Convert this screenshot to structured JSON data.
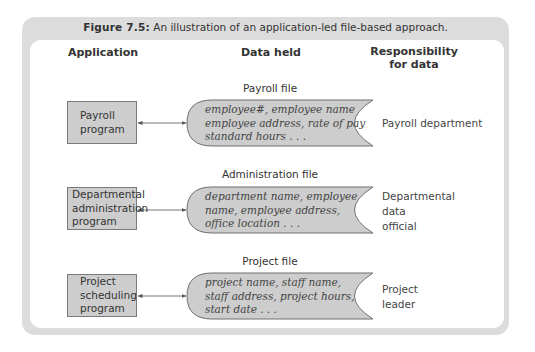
{
  "figure": {
    "label": "Figure 7.5:",
    "caption": " An illustration of an application-led file-based approach."
  },
  "headers": {
    "application": "Application",
    "data_held": "Data held",
    "responsibility_line1": "Responsibility",
    "responsibility_line2": "for data"
  },
  "rows": [
    {
      "file_label": "Payroll file",
      "application": [
        "Payroll",
        "program"
      ],
      "data": [
        "employee#, employee name",
        "employee address, rate of pay",
        "standard hours . . ."
      ],
      "responsibility": [
        "Payroll department"
      ]
    },
    {
      "file_label": "Administration file",
      "application": [
        "Departmental",
        "administration",
        "program"
      ],
      "data": [
        "department name, employee",
        "name, employee address,",
        "office location . . ."
      ],
      "responsibility": [
        "Departmental",
        "data",
        "official"
      ]
    },
    {
      "file_label": "Project file",
      "application": [
        "Project",
        "scheduling",
        "program"
      ],
      "data": [
        "project name, staff name,",
        "staff address, project hours,",
        "start date . . ."
      ],
      "responsibility": [
        "Project",
        "leader"
      ]
    }
  ],
  "colors": {
    "frame": "#dcdcdc",
    "box_fill": "#cdcdcd",
    "file_fill": "#cdcdcd",
    "stroke": "#6f6f6f"
  }
}
